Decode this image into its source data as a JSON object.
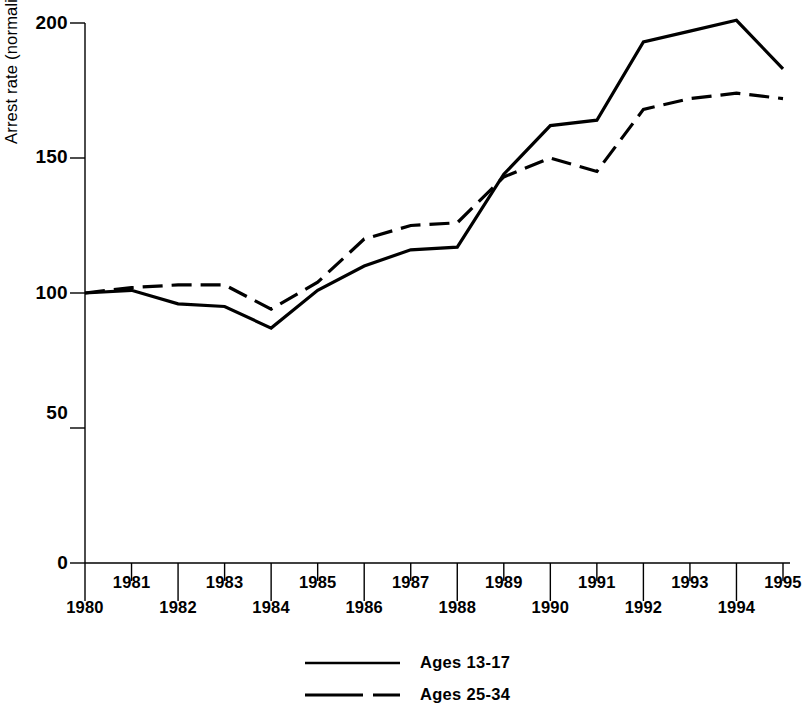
{
  "chart_data": {
    "type": "line",
    "title": "",
    "xlabel": "",
    "ylabel": "Arrest rate (normalized to 100 percent)",
    "x": [
      1980,
      1981,
      1982,
      1983,
      1984,
      1985,
      1986,
      1987,
      1988,
      1989,
      1990,
      1991,
      1992,
      1993,
      1994,
      1995
    ],
    "xlim": [
      1980,
      1995
    ],
    "ylim": [
      0,
      200
    ],
    "yticks": [
      0,
      50,
      100,
      150,
      200
    ],
    "xticks": [
      1980,
      1981,
      1982,
      1983,
      1984,
      1985,
      1986,
      1987,
      1988,
      1989,
      1990,
      1991,
      1992,
      1993,
      1994,
      1995
    ],
    "grid": false,
    "legend_position": "bottom-center",
    "series": [
      {
        "name": "Ages 13-17",
        "style": "solid",
        "color": "#000000",
        "values": [
          100,
          101,
          96,
          95,
          87,
          101,
          110,
          116,
          117,
          144,
          162,
          164,
          193,
          197,
          201,
          183
        ]
      },
      {
        "name": "Ages 25-34",
        "style": "dashed",
        "color": "#000000",
        "values": [
          100,
          102,
          103,
          103,
          94,
          104,
          120,
          125,
          126,
          143,
          150,
          145,
          168,
          172,
          174,
          172
        ]
      }
    ]
  },
  "axis": {
    "y_label": "Arrest rate (normalized to 100 percent)",
    "y_tick_labels": [
      "200",
      "150",
      "100",
      "50",
      "0"
    ],
    "x_tick_labels_upper": [
      "1981",
      "1983",
      "1985",
      "1987",
      "1989",
      "1991",
      "1993",
      "1995"
    ],
    "x_tick_labels_lower": [
      "1980",
      "1982",
      "1984",
      "1986",
      "1988",
      "1990",
      "1992",
      "1994"
    ]
  },
  "legend": {
    "entries": [
      {
        "label": "Ages 13-17",
        "style": "solid"
      },
      {
        "label": "Ages 25-34",
        "style": "dashed"
      }
    ]
  }
}
